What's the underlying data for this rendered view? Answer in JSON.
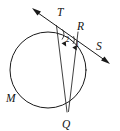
{
  "figure": {
    "kind": "circle-tangent-secant-geometry-diagram",
    "background_color": "#ffffff",
    "line_color": "#1a1a1a",
    "labels": {
      "point_t": "T",
      "point_r": "R",
      "point_s": "S",
      "point_m": "M",
      "point_q": "Q",
      "angle_two": "2",
      "angle_one": "1"
    },
    "geometry": {
      "circle": {
        "cx": 48,
        "cy": 70,
        "r": 38
      },
      "secant_line": {
        "x1": 33,
        "y1": 9,
        "x2": 109,
        "y2": 63
      },
      "chord_tangent_point_to_q": {
        "x1": 57,
        "y1": 25,
        "x2": 67,
        "y2": 112
      },
      "chord_r_to_circle": {
        "x1": 78,
        "y1": 32,
        "x2": 68,
        "y2": 112
      },
      "label_positions": {
        "point_t": {
          "x": 57,
          "y": 16
        },
        "point_r": {
          "x": 77,
          "y": 30
        },
        "point_s": {
          "x": 96,
          "y": 50
        },
        "point_m": {
          "x": 8,
          "y": 102
        },
        "point_q": {
          "x": 63,
          "y": 127
        },
        "angle_two": {
          "x": 67,
          "y": 41
        },
        "angle_one": {
          "x": 76,
          "y": 47
        }
      }
    }
  }
}
